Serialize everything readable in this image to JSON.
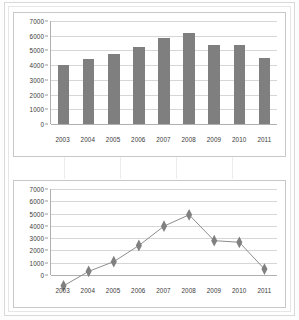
{
  "chart_data": [
    {
      "type": "bar",
      "title": "",
      "xlabel": "",
      "ylabel": "",
      "categories": [
        "2003",
        "2004",
        "2005",
        "2006",
        "2007",
        "2008",
        "2009",
        "2010",
        "2011"
      ],
      "values": [
        4000,
        4450,
        4750,
        5250,
        5850,
        6200,
        5400,
        5350,
        4520
      ],
      "yticks": [
        0,
        1000,
        2000,
        3000,
        4000,
        5000,
        6000,
        7000
      ],
      "ytick_labels": [
        "0",
        "1000",
        "2000",
        "3000",
        "4000",
        "5000",
        "6000",
        "7000"
      ],
      "ylim": [
        0,
        7000
      ],
      "grid": true,
      "legend": false,
      "series_color": "#7f7f7f"
    },
    {
      "type": "line",
      "title": "",
      "xlabel": "",
      "ylabel": "",
      "categories": [
        "2003",
        "2004",
        "2005",
        "2006",
        "2007",
        "2008",
        "2009",
        "2010",
        "2011"
      ],
      "values": [
        4000,
        4450,
        4750,
        5250,
        5850,
        6200,
        5400,
        5350,
        4520
      ],
      "yticks": [
        0,
        1000,
        2000,
        3000,
        4000,
        5000,
        6000,
        7000
      ],
      "ytick_labels": [
        "0",
        "1000",
        "2000",
        "3000",
        "4000",
        "5000",
        "6000",
        "7000"
      ],
      "ylim": [
        0,
        7000
      ],
      "grid": true,
      "legend": false,
      "marker": "diamond",
      "series_color": "#808080"
    }
  ]
}
